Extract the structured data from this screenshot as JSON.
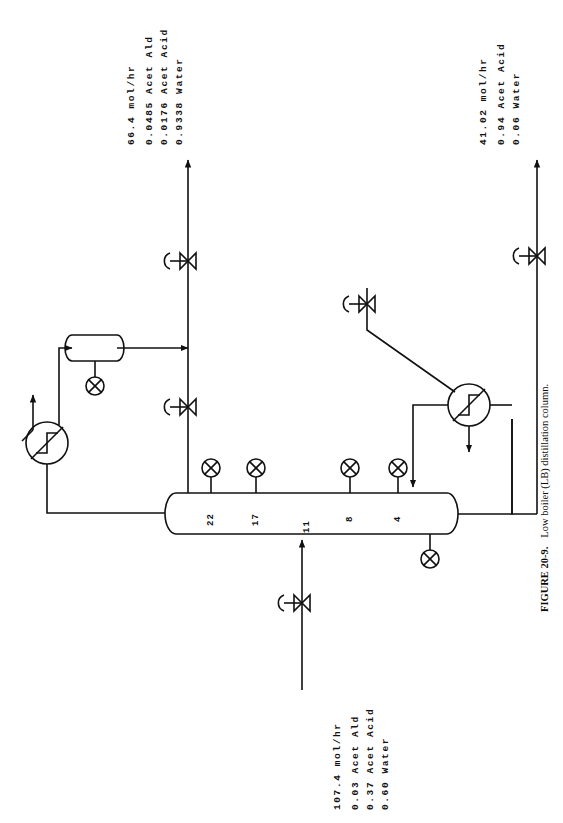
{
  "figure": {
    "id": "FIGURE 20-9.",
    "caption": "Low boiler (LB) distillation column.",
    "orientation": "rotated-90-ccw"
  },
  "streams": {
    "distillate": {
      "name": "overhead-distillate",
      "flow": "66.4 mol/hr",
      "components": [
        {
          "fraction": "0.0485",
          "name": "Acet Ald"
        },
        {
          "fraction": "0.0176",
          "name": "Acet Acid"
        },
        {
          "fraction": "0.9338",
          "name": "Water"
        }
      ]
    },
    "bottoms": {
      "name": "bottoms-product",
      "flow": "41.02 mol/hr",
      "components": [
        {
          "fraction": "0.94",
          "name": "Acet Acid"
        },
        {
          "fraction": "0.06",
          "name": "Water"
        }
      ]
    },
    "feed": {
      "name": "column-feed",
      "flow": "107.4 mol/hr",
      "components": [
        {
          "fraction": "0.03",
          "name": "Acet Ald"
        },
        {
          "fraction": "0.37",
          "name": "Acet Acid"
        },
        {
          "fraction": "0.60",
          "name": "Water"
        }
      ]
    }
  },
  "column": {
    "label": "distillation-column",
    "trays": [
      {
        "number": "22"
      },
      {
        "number": "17"
      },
      {
        "number": "11"
      },
      {
        "number": "8"
      },
      {
        "number": "4"
      }
    ]
  },
  "equipment": {
    "condenser": "condenser-heat-exchanger",
    "reflux_drum": "reflux-accumulator-drum",
    "reboiler": "reboiler-heat-exchanger"
  },
  "instruments": {
    "tray_sensors": 4,
    "drum_level": "reflux-drum-level-sensor",
    "bottoms_sensor": "bottoms-level-sensor"
  },
  "valves": {
    "distillate_valve": "distillate-control-valve",
    "reflux_valve": "reflux-control-valve",
    "steam_valve": "steam-control-valve",
    "bottoms_valve": "bottoms-control-valve",
    "feed_valve": "feed-control-valve"
  },
  "colors": {
    "line": "#111111",
    "background": "#ffffff"
  }
}
